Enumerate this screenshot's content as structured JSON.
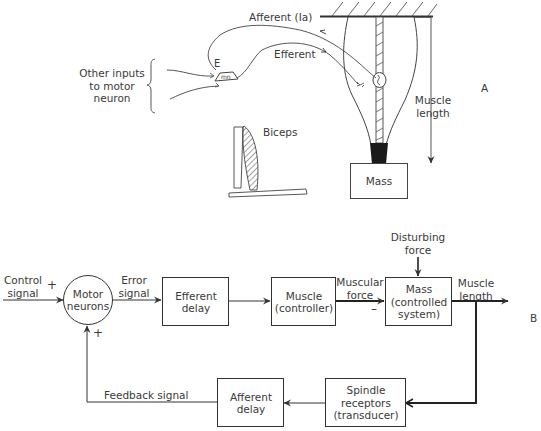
{
  "panel_a": {
    "panel_label": "A",
    "afferent_label": "Afferent (Ia)",
    "efferent_label": "Efferent",
    "neuron_label_e": "E",
    "neuron_label_mn": "mn",
    "other_inputs_label": "Other inputs\nto motor\nneuron",
    "biceps_label": "Biceps",
    "muscle_length_label": "Muscle\nlength",
    "mass_label": "Mass"
  },
  "panel_b": {
    "panel_label": "B",
    "control_signal_label": "Control\nsignal",
    "plus_input": "+",
    "plus_feedback": "+",
    "minus_sign": "–",
    "summing_node_label": "Motor\nneurons",
    "error_signal_label": "Error\nsignal",
    "blocks": {
      "efferent_delay": "Efferent\ndelay",
      "muscle": "Muscle\n(controller)",
      "mass": "Mass\n(controlled\nsystem)",
      "spindle": "Spindle\nreceptors\n(transducer)",
      "afferent_delay": "Afferent\ndelay"
    },
    "muscular_force_label": "Muscular\nforce",
    "disturbing_force_label": "Disturbing\nforce",
    "muscle_length_label": "Muscle\nlength",
    "feedback_signal_label": "Feedback signal"
  }
}
